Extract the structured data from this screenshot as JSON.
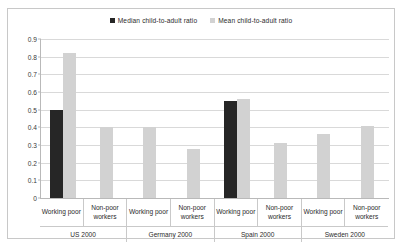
{
  "chart_data": {
    "type": "bar",
    "title": "",
    "subtitle": "",
    "xlabel": "",
    "ylabel": "",
    "ylim": [
      0,
      0.9
    ],
    "ytick_labels": [
      "0.9",
      "0.8",
      "0.7",
      "0.6",
      "0.5",
      "0.4",
      "0.3",
      "0.2",
      "0.1",
      "0"
    ],
    "ytick_values": [
      0.9,
      0.8,
      0.7,
      0.6,
      0.5,
      0.4,
      0.3,
      0.2,
      0.1,
      0
    ],
    "grid": true,
    "legend_position": "top-center",
    "groups": [
      "US 2000",
      "Germany 2000",
      "Spain 2000",
      "Sweden 2000"
    ],
    "categories": [
      "Working poor",
      "Non-poor workers",
      "Working poor",
      "Non-poor workers",
      "Working poor",
      "Non-poor workers",
      "Working poor",
      "Non-poor workers"
    ],
    "series": [
      {
        "name": "Median child-to-adult ratio",
        "color": "#262626",
        "values": [
          0.5,
          null,
          null,
          null,
          0.55,
          null,
          null,
          null
        ]
      },
      {
        "name": "Mean child-to-adult ratio",
        "color": "#d2d2d2",
        "values": [
          0.82,
          0.4,
          0.4,
          0.28,
          0.56,
          0.31,
          0.36,
          0.41
        ]
      }
    ]
  },
  "legend": {
    "entries": [
      {
        "label": "Median child-to-adult ratio",
        "color": "#262626"
      },
      {
        "label": "Mean child-to-adult ratio",
        "color": "#d2d2d2"
      }
    ]
  }
}
